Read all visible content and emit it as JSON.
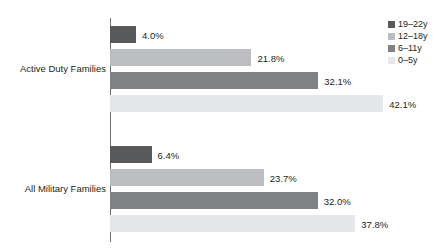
{
  "chart_data": {
    "type": "bar",
    "orientation": "horizontal",
    "title": "",
    "subtitle": "",
    "xlabel": "",
    "ylabel": "",
    "grid": false,
    "legend_position": "top-right",
    "xlim": [
      0,
      45
    ],
    "value_suffix": "%",
    "categories": [
      "Active Duty Families",
      "All Military Families"
    ],
    "series": [
      {
        "name": "19–22y",
        "color": "#58595b",
        "values": [
          4.0,
          6.4
        ],
        "labels": [
          "4.0%",
          "6.4%"
        ]
      },
      {
        "name": "12–18y",
        "color": "#bcbdc0",
        "values": [
          21.8,
          23.7
        ],
        "labels": [
          "21.8%",
          "23.7%"
        ]
      },
      {
        "name": "6–11y",
        "color": "#808184",
        "values": [
          32.1,
          32.0
        ],
        "labels": [
          "32.1%",
          "32.0%"
        ]
      },
      {
        "name": "0–5y",
        "color": "#e6e7e8",
        "values": [
          42.1,
          37.8
        ],
        "labels": [
          "42.1%",
          "37.8%"
        ]
      }
    ],
    "axis_color": "#6e6e6e",
    "text_color": "#231f20",
    "background": "#ffffff"
  },
  "legend": {
    "items": [
      {
        "label": "19–22y",
        "color": "#58595b"
      },
      {
        "label": "12–18y",
        "color": "#bcbdc0"
      },
      {
        "label": "6–11y",
        "color": "#808184"
      },
      {
        "label": "0–5y",
        "color": "#e6e7e8"
      }
    ]
  },
  "axis": {
    "categories": [
      {
        "label": "Active Duty Families"
      },
      {
        "label": "All Military Families"
      }
    ]
  }
}
